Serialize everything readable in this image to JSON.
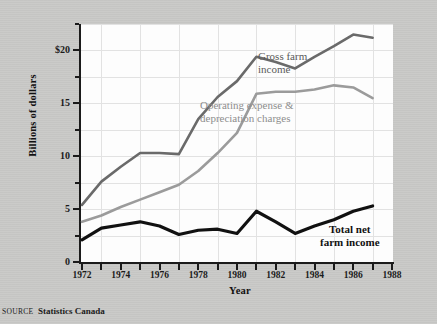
{
  "figure": {
    "source_prefix": "SOURCE",
    "source_text": "Statistics Canada"
  },
  "chart_data": {
    "type": "line",
    "title": "",
    "xlabel": "Year",
    "ylabel": "Billions of dollars",
    "xlim": [
      1972,
      1988
    ],
    "ylim": [
      0,
      22.5
    ],
    "ytick_labels": [
      "$20",
      "15",
      "10",
      "5",
      "0"
    ],
    "ytick_values": [
      20,
      15,
      10,
      5,
      0
    ],
    "yminor_values": [
      22.5,
      17.5,
      12.5,
      7.5,
      2.5
    ],
    "xtick_values": [
      1972,
      1973,
      1974,
      1975,
      1976,
      1977,
      1978,
      1979,
      1980,
      1981,
      1982,
      1983,
      1984,
      1985,
      1986,
      1987,
      1988
    ],
    "xtick_labels": [
      "1972",
      "",
      "1974",
      "",
      "1976",
      "",
      "1978",
      "",
      "1980",
      "",
      "1982",
      "",
      "1984",
      "",
      "1986",
      "",
      "1988"
    ],
    "grid": true,
    "legend_position": "inline-annotations",
    "x": [
      1972,
      1973,
      1974,
      1975,
      1976,
      1977,
      1978,
      1979,
      1980,
      1981,
      1982,
      1983,
      1984,
      1985,
      1986,
      1987
    ],
    "series": [
      {
        "name": "Gross farm income",
        "color": "#6a6a6a",
        "label_line1": "Gross farm",
        "label_line2": "income",
        "values": [
          5.4,
          7.6,
          9.0,
          10.3,
          10.3,
          10.2,
          13.5,
          15.6,
          17.1,
          19.4,
          18.9,
          18.3,
          19.4,
          20.4,
          21.5,
          21.2
        ]
      },
      {
        "name": "Operating expense & depreciation charges",
        "color": "#9b9b9b",
        "label_line1": "Operating expense &",
        "label_line2": "depreciation charges",
        "values": [
          3.8,
          4.4,
          5.2,
          5.9,
          6.6,
          7.3,
          8.6,
          10.3,
          12.2,
          15.9,
          16.1,
          16.1,
          16.3,
          16.7,
          16.5,
          15.5
        ]
      },
      {
        "name": "Total net farm income",
        "color": "#111111",
        "label_line1": "Total net",
        "label_line2": "farm income",
        "values": [
          2.1,
          3.2,
          3.5,
          3.8,
          3.4,
          2.6,
          3.0,
          3.1,
          2.7,
          4.8,
          3.8,
          2.7,
          3.4,
          4.0,
          4.8,
          5.3
        ]
      }
    ]
  }
}
